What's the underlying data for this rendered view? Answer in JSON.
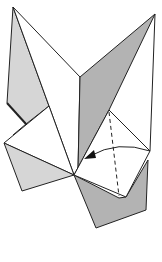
{
  "diagram": {
    "type": "origami-fold-step",
    "colors": {
      "paper_white": "#ffffff",
      "paper_light_grey": "#d6d6d6",
      "paper_mid_grey": "#b3b3b3",
      "line": "#222222"
    },
    "elements": [
      "left-flap",
      "right-flap",
      "left-square",
      "right-square",
      "valley-fold-dashed-line",
      "fold-arrow"
    ]
  }
}
